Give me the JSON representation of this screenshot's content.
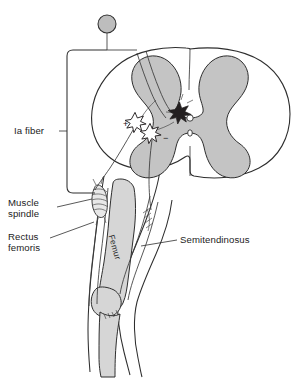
{
  "figure": {
    "background_color": "#ffffff",
    "line_color": "#2e2e2e",
    "gray_matter_color": "#c4c4c4",
    "ganglion_color": "#bdbdbd",
    "bone_color": "#d6d6d6",
    "interneuron_color": "#231f20"
  },
  "labels": {
    "ia_fiber": "Ia fiber",
    "muscle_spindle_line1": "Muscle",
    "muscle_spindle_line2": "spindle",
    "rectus_femoris_line1": "Rectus",
    "rectus_femoris_line2": "femoris",
    "semitendinosus": "Semitendinosus",
    "femur": "Femur"
  },
  "synapse_signs": {
    "excitatory": "+",
    "inhibitory": "−"
  },
  "structures": {
    "dorsal_root_ganglion": "dorsal-root-ganglion",
    "spinal_cord": "spinal-cord-cross-section",
    "gray_matter": "gray-matter-butterfly",
    "central_canal": "central-canal",
    "inhibitory_interneuron": "inhibitory-interneuron",
    "motor_neuron_excited": "alpha-motor-neuron-rectus-femoris",
    "motor_neuron_inhibited": "alpha-motor-neuron-semitendinosus",
    "muscle_spindle": "muscle-spindle-organ",
    "femur_bone": "femur-bone",
    "leg": "leg-outline"
  }
}
